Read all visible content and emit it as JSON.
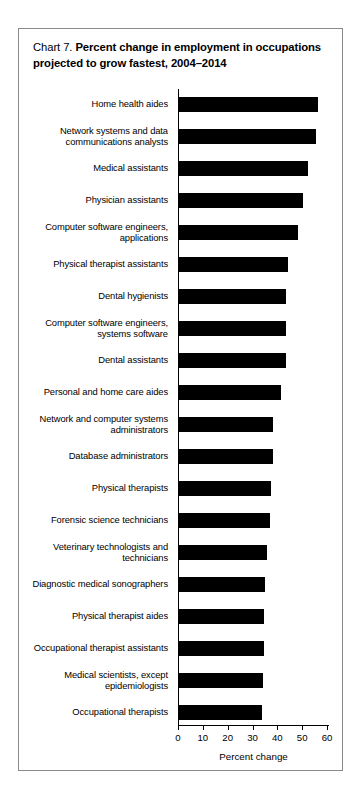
{
  "figure": {
    "chart_number": "Chart 7.",
    "title": "Percent change in employment in occupations projected to grow fastest, 2004–2014"
  },
  "chart_data": {
    "type": "bar",
    "orientation": "horizontal",
    "title": "Chart 7. Percent change in employment in occupations projected to grow fastest, 2004–2014",
    "xlabel": "Percent change",
    "ylabel": "",
    "xlim": [
      0,
      60
    ],
    "xticks": [
      0,
      10,
      20,
      30,
      40,
      50,
      60
    ],
    "grid": false,
    "legend": false,
    "bar_color": "#000000",
    "categories": [
      "Home health aides",
      "Network systems and data communications analysts",
      "Medical assistants",
      "Physician assistants",
      "Computer software engineers, applications",
      "Physical therapist assistants",
      "Dental hygienists",
      "Computer software engineers, systems software",
      "Dental assistants",
      "Personal and home care aides",
      "Network and computer systems administrators",
      "Database administrators",
      "Physical therapists",
      "Forensic science technicians",
      "Veterinary technologists and technicians",
      "Diagnostic medical sonographers",
      "Physical therapist aides",
      "Occupational therapist assistants",
      "Medical scientists, except epidemiologists",
      "Occupational therapists"
    ],
    "values": [
      56,
      55,
      52,
      50,
      48,
      44,
      43,
      43,
      43,
      41,
      38,
      38,
      37,
      36.5,
      35.5,
      34.8,
      34.4,
      34.1,
      34,
      33.6
    ]
  },
  "axis": {
    "tick_labels": [
      "0",
      "10",
      "20",
      "30",
      "40",
      "50",
      "60"
    ],
    "title": "Percent change"
  }
}
